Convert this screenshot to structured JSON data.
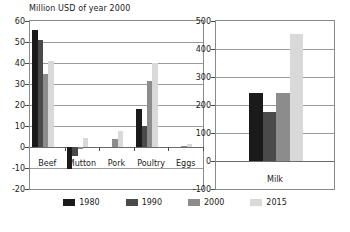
{
  "chart_data": [
    {
      "type": "bar",
      "id": "meat-panel",
      "title": "Million USD of year 2000",
      "xlabel": "",
      "ylabel": "",
      "categories": [
        "Beef",
        "Mutton",
        "Pork",
        "Poultry",
        "Eggs"
      ],
      "series": [
        {
          "name": "1980",
          "color": "#1a1a1a",
          "values": [
            55.5,
            -10.5,
            0,
            18,
            0
          ]
        },
        {
          "name": "1990",
          "color": "#4a4a4a",
          "values": [
            51,
            -4.5,
            0,
            10,
            0
          ]
        },
        {
          "name": "2000",
          "color": "#8c8c8c",
          "values": [
            35,
            -1,
            4,
            31.5,
            0.3
          ]
        },
        {
          "name": "2015",
          "color": "#d9d9d9",
          "values": [
            41,
            4.5,
            7.5,
            40,
            1.5
          ]
        }
      ],
      "ylim": [
        -20,
        60
      ],
      "yticks": [
        60,
        50,
        40,
        30,
        20,
        10,
        0,
        -10,
        -20
      ],
      "grid": true,
      "legend_position": "bottom"
    },
    {
      "type": "bar",
      "id": "milk-panel",
      "title": "",
      "xlabel": "",
      "ylabel": "",
      "categories": [
        "Milk"
      ],
      "series": [
        {
          "name": "1980",
          "color": "#1a1a1a",
          "values": [
            243
          ]
        },
        {
          "name": "1990",
          "color": "#4a4a4a",
          "values": [
            175
          ]
        },
        {
          "name": "2000",
          "color": "#8c8c8c",
          "values": [
            243
          ]
        },
        {
          "name": "2015",
          "color": "#d9d9d9",
          "values": [
            452
          ]
        }
      ],
      "ylim": [
        -100,
        500
      ],
      "yticks": [
        500,
        400,
        300,
        200,
        100,
        0,
        -100
      ],
      "grid": true,
      "legend_position": "bottom"
    }
  ],
  "legend": {
    "items": [
      {
        "label": "1980",
        "color": "#1a1a1a"
      },
      {
        "label": "1990",
        "color": "#4a4a4a"
      },
      {
        "label": "2000",
        "color": "#8c8c8c"
      },
      {
        "label": "2015",
        "color": "#d9d9d9"
      }
    ]
  }
}
